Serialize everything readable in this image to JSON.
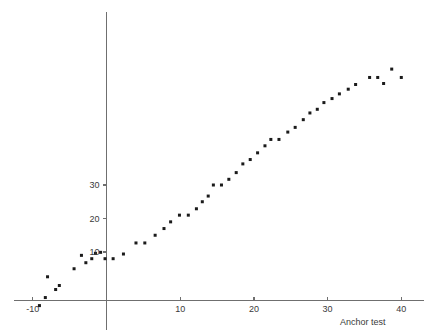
{
  "chart_data": {
    "type": "scatter",
    "title": "",
    "xlabel": "Anchor test",
    "ylabel": "",
    "xlim": [
      -12.5,
      44
    ],
    "ylim": [
      -10,
      61
    ],
    "grid": false,
    "legend": null,
    "xticks": [
      -10,
      10,
      20,
      30,
      40
    ],
    "yticks": [
      10,
      20,
      30
    ],
    "xtick_labels": [
      "-10",
      "10",
      "20",
      "30",
      "40"
    ],
    "ytick_labels": [
      "10",
      "20",
      "30"
    ],
    "marker": "square",
    "marker_color": "#1a1a1a",
    "marker_size": 3,
    "points": [
      [
        -9.1,
        -6.0
      ],
      [
        -8.3,
        -3.6
      ],
      [
        -8.0,
        2.6
      ],
      [
        -6.9,
        -1.2
      ],
      [
        -6.4,
        0.0
      ],
      [
        -4.4,
        5.0
      ],
      [
        -3.4,
        9.0
      ],
      [
        -2.8,
        6.8
      ],
      [
        -2.0,
        8.0
      ],
      [
        -1.5,
        9.6
      ],
      [
        -0.8,
        9.9
      ],
      [
        -0.2,
        8.0
      ],
      [
        0.9,
        8.0
      ],
      [
        2.3,
        9.4
      ],
      [
        4.0,
        12.7
      ],
      [
        5.2,
        12.7
      ],
      [
        6.6,
        15.0
      ],
      [
        7.8,
        17.0
      ],
      [
        8.7,
        19.0
      ],
      [
        9.9,
        21.0
      ],
      [
        11.1,
        21.0
      ],
      [
        12.2,
        22.9
      ],
      [
        13.0,
        25.0
      ],
      [
        13.8,
        26.7
      ],
      [
        14.5,
        30.0
      ],
      [
        15.6,
        30.0
      ],
      [
        16.6,
        31.7
      ],
      [
        17.6,
        33.7
      ],
      [
        18.5,
        36.3
      ],
      [
        19.5,
        37.6
      ],
      [
        20.5,
        39.6
      ],
      [
        21.5,
        41.7
      ],
      [
        22.3,
        43.6
      ],
      [
        23.4,
        43.6
      ],
      [
        24.6,
        45.8
      ],
      [
        25.6,
        47.2
      ],
      [
        26.7,
        49.5
      ],
      [
        27.6,
        51.5
      ],
      [
        28.6,
        52.6
      ],
      [
        29.5,
        54.6
      ],
      [
        30.6,
        55.8
      ],
      [
        31.6,
        57.2
      ],
      [
        32.8,
        58.6
      ],
      [
        33.8,
        60.0
      ],
      [
        35.7,
        62.1
      ],
      [
        36.8,
        62.1
      ],
      [
        37.6,
        60.3
      ],
      [
        38.7,
        64.6
      ],
      [
        40.0,
        62.1
      ]
    ]
  },
  "axis": {
    "x_title": "Anchor test"
  }
}
